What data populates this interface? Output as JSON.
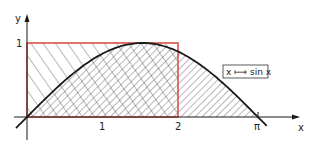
{
  "diagram": {
    "function_label": "x ⟼ sin x",
    "axes": {
      "x_label": "x",
      "y_label": "y",
      "x_ticks": [
        {
          "value": 1,
          "label": "1"
        },
        {
          "value": 2,
          "label": "2"
        },
        {
          "value": 3.14159,
          "label": "π"
        }
      ],
      "y_ticks": [
        {
          "value": 1,
          "label": "1"
        }
      ]
    },
    "curve": {
      "function": "sin x",
      "domain": [
        0,
        3.14159
      ]
    },
    "rectangle": {
      "x_range": [
        0,
        2
      ],
      "y_range": [
        0,
        1
      ],
      "color": "#d9534a"
    },
    "colors": {
      "ink": "#1a1a1a",
      "rectangle": "#d9534a",
      "hatch": "#333333"
    }
  }
}
